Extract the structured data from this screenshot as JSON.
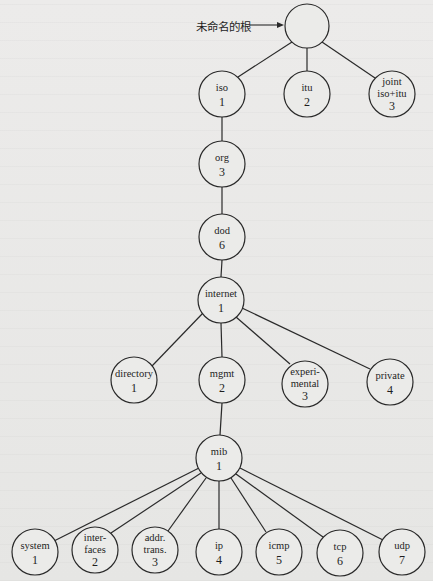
{
  "root": {
    "annotation": "未命名的根",
    "arrow": "→"
  },
  "nodes": {
    "iso": {
      "name": "iso",
      "num": "1"
    },
    "itu": {
      "name": "itu",
      "num": "2"
    },
    "joint": {
      "line1": "joint",
      "line2": "iso+itu",
      "num": "3"
    },
    "org": {
      "name": "org",
      "num": "3"
    },
    "dod": {
      "name": "dod",
      "num": "6"
    },
    "internet": {
      "name": "internet",
      "num": "1"
    },
    "directory": {
      "name": "directory",
      "num": "1"
    },
    "mgmt": {
      "name": "mgmt",
      "num": "2"
    },
    "experimental": {
      "line1": "experi-",
      "line2": "mental",
      "num": "3"
    },
    "private": {
      "name": "private",
      "num": "4"
    },
    "mib": {
      "name": "mib",
      "num": "1"
    },
    "system": {
      "name": "system",
      "num": "1"
    },
    "interfaces": {
      "line1": "inter-",
      "line2": "faces",
      "num": "2"
    },
    "addrtrans": {
      "line1": "addr.",
      "line2": "trans.",
      "num": "3"
    },
    "ip": {
      "name": "ip",
      "num": "4"
    },
    "icmp": {
      "name": "icmp",
      "num": "5"
    },
    "tcp": {
      "name": "tcp",
      "num": "6"
    },
    "udp": {
      "name": "udp",
      "num": "7"
    }
  }
}
